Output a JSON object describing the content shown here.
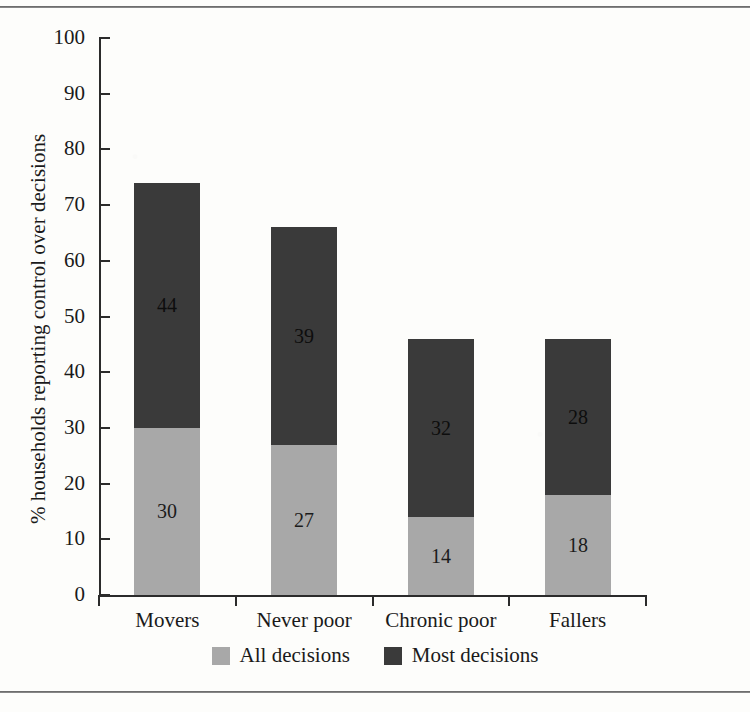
{
  "figure": {
    "background": "#fdfdfb",
    "rule_color": "#4a4a4a"
  },
  "chart_data": {
    "type": "bar",
    "subtype": "stacked-bar",
    "title": "",
    "xlabel": "",
    "ylabel": "% households reporting control over decisions",
    "categories": [
      "Movers",
      "Never poor",
      "Chronic poor",
      "Fallers"
    ],
    "ylim": [
      0,
      100
    ],
    "yticks": [
      0,
      10,
      20,
      30,
      40,
      50,
      60,
      70,
      80,
      90,
      100
    ],
    "ytick_labels": [
      "0",
      "10",
      "20",
      "30",
      "40",
      "50",
      "60",
      "70",
      "80",
      "90",
      "100"
    ],
    "grid": false,
    "legend_position": "bottom-center",
    "series": [
      {
        "name": "All decisions",
        "color": "#a8a8a8",
        "values": [
          30,
          27,
          14,
          18
        ],
        "labels": [
          "30",
          "27",
          "14",
          "18"
        ]
      },
      {
        "name": "Most decisions",
        "color": "#3a3a3a",
        "values": [
          44,
          39,
          32,
          28
        ],
        "labels": [
          "44",
          "39",
          "32",
          "28"
        ]
      }
    ],
    "totals": [
      74,
      66,
      46,
      47
    ]
  },
  "legend": {
    "items": [
      {
        "label": "All decisions",
        "swatch": "#a8a8a8"
      },
      {
        "label": "Most decisions",
        "swatch": "#3a3a3a"
      }
    ]
  }
}
